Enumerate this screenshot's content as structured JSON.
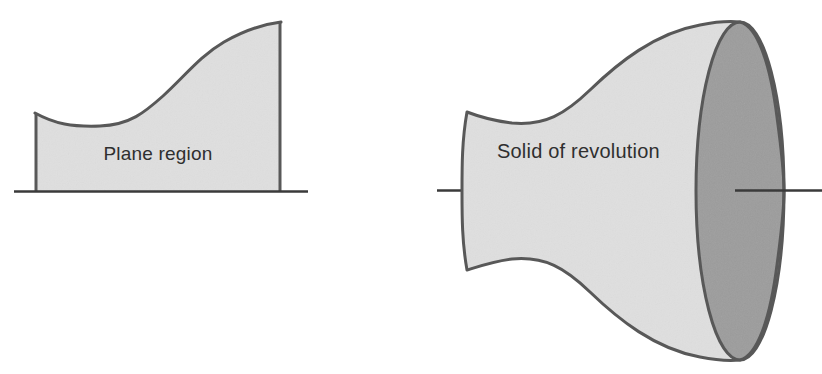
{
  "page": {
    "background_color": "#ffffff",
    "width": 822,
    "height": 374
  },
  "palette": {
    "light_fill": "#dfdfdf",
    "dark_fill": "#9c9c9c",
    "stroke": "#585858",
    "axis_line": "#3a3a3a",
    "label_text": "#2f2f2f"
  },
  "figures": [
    {
      "id": "plane-region",
      "label": "Plane region",
      "label_position": {
        "x": 158,
        "y": 160
      },
      "description": "Shaded two-dimensional region bounded below by a horizontal baseline, on the left and right by vertical segments, and above by an S-shaped curve that dips then rises.",
      "baseline": {
        "x1": 14,
        "y1": 192,
        "x2": 308,
        "y2": 192
      },
      "left_edge": {
        "x": 35,
        "y_top": 113,
        "y_bottom": 191
      },
      "right_edge": {
        "x": 281,
        "y_top": 22,
        "y_bottom": 191
      },
      "curve_points": [
        {
          "x": 35,
          "y": 113
        },
        {
          "x": 100,
          "y": 126
        },
        {
          "x": 160,
          "y": 98
        },
        {
          "x": 215,
          "y": 50
        },
        {
          "x": 281,
          "y": 22
        }
      ]
    },
    {
      "id": "solid-of-revolution",
      "label": "Solid of revolution",
      "label_position": {
        "x": 497,
        "y": 158
      },
      "description": "Three-dimensional solid formed by revolving the plane region about a horizontal axis; flared trumpet shape with a narrow left end, a waist, and a large dark elliptical face on the right.",
      "axis_left_stub": {
        "x1": 437,
        "y1": 190,
        "x2": 468,
        "y2": 190
      },
      "axis_right_stub": {
        "x1": 735,
        "y1": 190,
        "x2": 822,
        "y2": 190
      },
      "dark_face_ellipse": {
        "cx": 740,
        "cy": 191,
        "rx": 44,
        "ry": 169
      },
      "left_cap_arc": {
        "x": 467,
        "y_top": 112,
        "y_bottom": 270,
        "bulge_x": 462
      },
      "silhouette_top": [
        {
          "x": 467,
          "y": 112
        },
        {
          "x": 510,
          "y": 123
        },
        {
          "x": 580,
          "y": 96
        },
        {
          "x": 665,
          "y": 40
        },
        {
          "x": 740,
          "y": 22
        }
      ],
      "silhouette_bottom": [
        {
          "x": 467,
          "y": 270
        },
        {
          "x": 510,
          "y": 259
        },
        {
          "x": 580,
          "y": 286
        },
        {
          "x": 665,
          "y": 342
        },
        {
          "x": 740,
          "y": 360
        }
      ]
    }
  ]
}
